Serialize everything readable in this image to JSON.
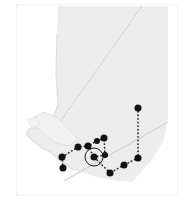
{
  "figure": {
    "kind": "locator-map",
    "region_label": "British Columbia",
    "background_color": "#ffffff",
    "land_fill": "#f0f0f0",
    "land_texture": "halftone-dither",
    "border_stroke": "#c9c9c9",
    "frame_stroke": "#f4f4f4",
    "marker_color": "#111111",
    "route_color": "#222222",
    "highlight_ring_color": "#1a1a1a",
    "width": 194,
    "height": 217
  },
  "map_data": {
    "type": "point-route-map",
    "title": "",
    "projection_note": "",
    "land_outline": "M 60 6 L 142 6 L 60 122 L 140 6 L 168 6 L 168 120 L 150 160 L 128 182 L 96 178 L 70 168 L 52 150 L 36 140 L 28 128 L 44 120 L 58 108 L 56 70 L 58 30 Z",
    "markers": [
      {
        "id": "m1",
        "x": 138,
        "y": 108,
        "size": 7,
        "highlighted": false
      },
      {
        "id": "m2",
        "x": 138,
        "y": 158,
        "size": 7,
        "highlighted": false
      },
      {
        "id": "m3",
        "x": 124,
        "y": 165,
        "size": 7,
        "highlighted": false
      },
      {
        "id": "m4",
        "x": 110,
        "y": 173,
        "size": 7,
        "highlighted": false
      },
      {
        "id": "m5",
        "x": 105,
        "y": 155,
        "size": 6,
        "highlighted": false
      },
      {
        "id": "m6",
        "x": 104,
        "y": 138,
        "size": 7,
        "highlighted": false
      },
      {
        "id": "m7",
        "x": 97,
        "y": 141,
        "size": 6,
        "highlighted": false
      },
      {
        "id": "m8",
        "x": 94,
        "y": 157,
        "size": 7,
        "highlighted": true
      },
      {
        "id": "m9",
        "x": 88,
        "y": 146,
        "size": 7,
        "highlighted": false
      },
      {
        "id": "m10",
        "x": 78,
        "y": 147,
        "size": 7,
        "highlighted": false
      },
      {
        "id": "m11",
        "x": 62,
        "y": 157,
        "size": 7,
        "highlighted": false
      },
      {
        "id": "m12",
        "x": 63,
        "y": 168,
        "size": 7,
        "highlighted": false
      }
    ],
    "routes": [
      {
        "id": "r1",
        "from": "m1",
        "to": "m2",
        "style": "dotted"
      },
      {
        "id": "r2",
        "from": "m2",
        "to": "m3",
        "style": "dotted"
      },
      {
        "id": "r3",
        "from": "m3",
        "to": "m4",
        "style": "dotted"
      },
      {
        "id": "r4",
        "from": "m4",
        "to": "m8",
        "style": "dotted"
      },
      {
        "id": "r5",
        "from": "m8",
        "to": "m5",
        "style": "dotted"
      },
      {
        "id": "r6",
        "from": "m5",
        "to": "m6",
        "style": "dotted"
      },
      {
        "id": "r7",
        "from": "m6",
        "to": "m7",
        "style": "dotted"
      },
      {
        "id": "r8",
        "from": "m7",
        "to": "m9",
        "style": "dotted"
      },
      {
        "id": "r9",
        "from": "m9",
        "to": "m10",
        "style": "dotted"
      },
      {
        "id": "r10",
        "from": "m10",
        "to": "m11",
        "style": "dotted"
      },
      {
        "id": "r11",
        "from": "m11",
        "to": "m12",
        "style": "dotted"
      },
      {
        "id": "r12",
        "from": "m9",
        "to": "m8",
        "style": "dotted"
      }
    ],
    "legend": [],
    "labels": []
  }
}
